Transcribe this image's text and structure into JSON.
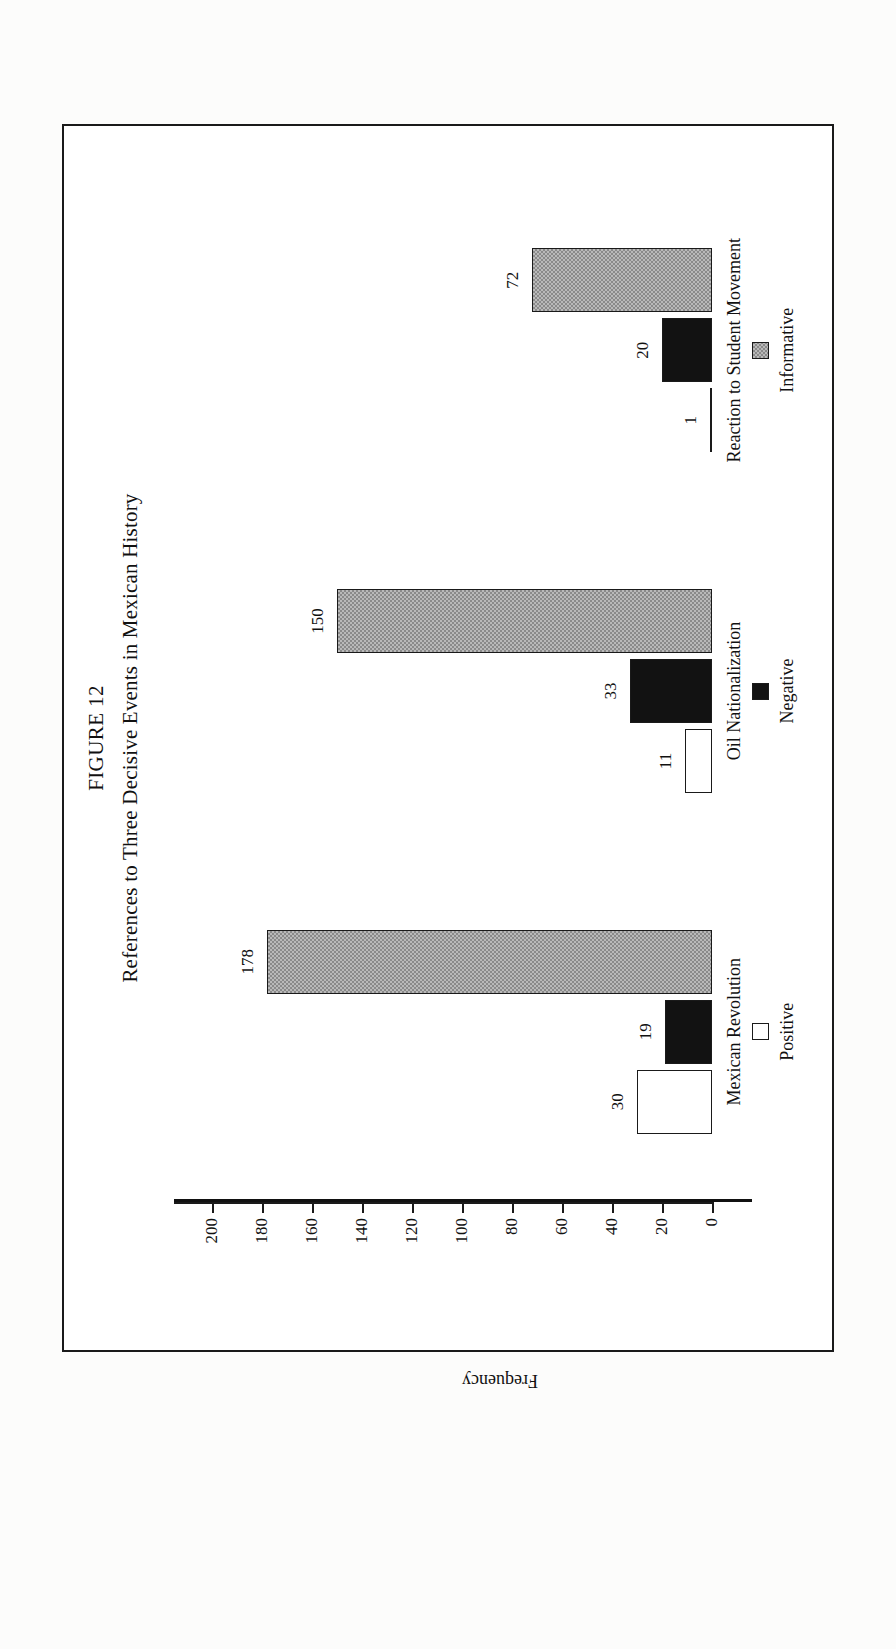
{
  "figure": {
    "number_label": "FIGURE 12",
    "title": "References to Three Decisive Events in Mexican History"
  },
  "chart_data": {
    "type": "bar",
    "title": "References to Three Decisive Events in Mexican History",
    "subtitle": "FIGURE 12",
    "xlabel": "",
    "ylabel": "Frequency",
    "ylim": [
      0,
      200
    ],
    "yticks": [
      "0",
      "20",
      "40",
      "60",
      "80",
      "100",
      "120",
      "140",
      "160",
      "180",
      "200"
    ],
    "grid": false,
    "legend_position": "bottom",
    "orientation": "page-rotated-90-ccw",
    "categories": [
      "Mexican Revolution",
      "Oil Nationalization",
      "Reaction to Student Movement"
    ],
    "series": [
      {
        "name": "Positive",
        "color": "#ffffff",
        "pattern": "solid-white",
        "values": [
          30,
          11,
          1
        ]
      },
      {
        "name": "Negative",
        "color": "#121212",
        "pattern": "solid-black",
        "values": [
          19,
          33,
          20
        ]
      },
      {
        "name": "Informative",
        "color": "#b9b9b9",
        "pattern": "checkered",
        "values": [
          178,
          150,
          72
        ]
      }
    ],
    "data_labels": [
      {
        "category": "Mexican Revolution",
        "series": "Positive",
        "value": 30,
        "text": "30"
      },
      {
        "category": "Mexican Revolution",
        "series": "Negative",
        "value": 19,
        "text": "19"
      },
      {
        "category": "Mexican Revolution",
        "series": "Informative",
        "value": 178,
        "text": "178"
      },
      {
        "category": "Oil Nationalization",
        "series": "Positive",
        "value": 11,
        "text": "11"
      },
      {
        "category": "Oil Nationalization",
        "series": "Negative",
        "value": 33,
        "text": "33"
      },
      {
        "category": "Oil Nationalization",
        "series": "Informative",
        "value": 150,
        "text": "150"
      },
      {
        "category": "Reaction to Student Movement",
        "series": "Positive",
        "value": 1,
        "text": "1"
      },
      {
        "category": "Reaction to Student Movement",
        "series": "Negative",
        "value": 20,
        "text": "20"
      },
      {
        "category": "Reaction to Student Movement",
        "series": "Informative",
        "value": 72,
        "text": "72"
      }
    ]
  }
}
